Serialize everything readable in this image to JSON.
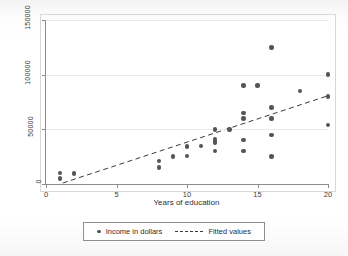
{
  "chart_data": {
    "type": "scatter",
    "title": "",
    "xlabel": "Years of education",
    "ylabel": "",
    "xlim": [
      0,
      20
    ],
    "ylim": [
      0,
      150000
    ],
    "xticks": [
      0,
      5,
      10,
      15,
      20
    ],
    "yticks": [
      0,
      50000,
      100000,
      150000
    ],
    "xtick_labels": [
      "0",
      "5",
      "10",
      "15",
      "20"
    ],
    "ytick_labels": [
      "0",
      "50000",
      "100000",
      "150000"
    ],
    "grid": "horizontal",
    "legend_position": "bottom-center",
    "marker_color": "#545459",
    "line_color": "#3a3a3a",
    "series": [
      {
        "name": "Income in dollars",
        "type": "scatter",
        "points": [
          {
            "x": 1,
            "y": 10000
          },
          {
            "x": 1,
            "y": 5000
          },
          {
            "x": 2,
            "y": 9500
          },
          {
            "x": 8,
            "y": 21000
          },
          {
            "x": 8,
            "y": 15000
          },
          {
            "x": 9,
            "y": 25000
          },
          {
            "x": 10,
            "y": 35000
          },
          {
            "x": 10,
            "y": 34000
          },
          {
            "x": 10,
            "y": 25500
          },
          {
            "x": 11,
            "y": 35000
          },
          {
            "x": 12,
            "y": 50000
          },
          {
            "x": 12,
            "y": 41000
          },
          {
            "x": 12,
            "y": 39000
          },
          {
            "x": 12,
            "y": 37500
          },
          {
            "x": 12,
            "y": 30000
          },
          {
            "x": 13,
            "y": 50000
          },
          {
            "x": 14,
            "y": 90000
          },
          {
            "x": 14,
            "y": 65000
          },
          {
            "x": 14,
            "y": 60000
          },
          {
            "x": 14,
            "y": 40000
          },
          {
            "x": 14,
            "y": 30000
          },
          {
            "x": 15,
            "y": 90000
          },
          {
            "x": 16,
            "y": 125000
          },
          {
            "x": 16,
            "y": 70000
          },
          {
            "x": 16,
            "y": 60000
          },
          {
            "x": 16,
            "y": 45000
          },
          {
            "x": 16,
            "y": 25000
          },
          {
            "x": 18,
            "y": 85000
          },
          {
            "x": 20,
            "y": 100000
          },
          {
            "x": 20,
            "y": 80000
          },
          {
            "x": 20,
            "y": 54000
          }
        ]
      },
      {
        "name": "Fitted values",
        "type": "line",
        "style": "dashed",
        "endpoints": [
          {
            "x": 1.2,
            "y": 0
          },
          {
            "x": 20,
            "y": 80000
          }
        ]
      }
    ]
  },
  "legend": {
    "items": [
      {
        "label": "Income in dollars",
        "marker": "dot"
      },
      {
        "label": "Fitted values",
        "marker": "dashed-line"
      }
    ]
  },
  "axes": {
    "x_title": "Years of education"
  }
}
